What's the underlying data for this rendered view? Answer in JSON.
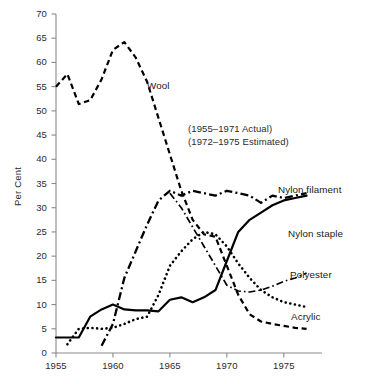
{
  "chart_data": {
    "type": "line",
    "title": "",
    "xlabel": "",
    "ylabel": "Per Cent",
    "xlim": [
      1955,
      1977.3
    ],
    "ylim": [
      0,
      70
    ],
    "grid": false,
    "legend_position": "inline-labels",
    "xticks": [
      1955,
      1960,
      1965,
      1970,
      1975
    ],
    "xtick_labels": [
      "1955",
      "1960",
      "1965",
      "1970",
      "1975"
    ],
    "yticks": [
      0,
      5,
      10,
      15,
      20,
      25,
      30,
      35,
      40,
      45,
      50,
      55,
      60,
      65,
      70
    ],
    "ytick_labels": [
      "0",
      "5",
      "10",
      "15",
      "20",
      "25",
      "30",
      "35",
      "40",
      "45",
      "50",
      "55",
      "60",
      "65",
      "70"
    ],
    "annotations": [
      "(1955–1971 Actual)",
      "(1972–1975 Estimated)"
    ],
    "series": [
      {
        "name": "Wool",
        "label": "Wool",
        "style": "dashed",
        "x": [
          1955,
          1956,
          1957,
          1958,
          1959,
          1960,
          1961,
          1962,
          1963,
          1964,
          1965,
          1966,
          1967,
          1968,
          1969,
          1970,
          1971,
          1972,
          1973,
          1974,
          1975,
          1976,
          1977
        ],
        "values": [
          55.0,
          57.6,
          51.4,
          52.2,
          56.5,
          62.6,
          64.2,
          61.0,
          56.0,
          48.5,
          41.0,
          33.5,
          27.5,
          24.5,
          24.0,
          18.0,
          12.0,
          8.0,
          6.5,
          6.0,
          5.6,
          5.2,
          5.0
        ]
      },
      {
        "name": "Nylon filament",
        "label": "Nylon filament",
        "style": "dashdot",
        "x": [
          1959,
          1960,
          1961,
          1962,
          1963,
          1964,
          1965,
          1966,
          1967,
          1968,
          1969,
          1970,
          1971,
          1972,
          1973,
          1974,
          1975,
          1976,
          1977
        ],
        "values": [
          1.5,
          6.0,
          15.5,
          21.0,
          26.5,
          31.5,
          33.5,
          32.5,
          33.5,
          33.0,
          32.5,
          33.5,
          33.0,
          32.5,
          31.0,
          32.5,
          32.0,
          32.5,
          33.0
        ]
      },
      {
        "name": "Nylon staple",
        "label": "Nylon staple",
        "style": "solid",
        "x": [
          1955,
          1956,
          1957,
          1958,
          1959,
          1960,
          1961,
          1962,
          1963,
          1964,
          1965,
          1966,
          1967,
          1968,
          1969,
          1970,
          1971,
          1972,
          1973,
          1974,
          1975,
          1976,
          1977
        ],
        "values": [
          3.2,
          3.2,
          3.2,
          7.5,
          9.0,
          10.0,
          9.0,
          8.8,
          8.8,
          8.6,
          11.0,
          11.5,
          10.5,
          11.5,
          13.0,
          19.0,
          25.0,
          27.5,
          29.0,
          30.5,
          31.5,
          32.0,
          32.5
        ]
      },
      {
        "name": "Polyester",
        "label": "Polyester",
        "style": "dashdot-thin",
        "x": [
          1965,
          1966,
          1967,
          1968,
          1969,
          1970,
          1971,
          1972,
          1973,
          1974,
          1975,
          1976,
          1977
        ],
        "values": [
          33.0,
          30.0,
          26.0,
          22.0,
          18.0,
          14.0,
          12.8,
          12.6,
          13.0,
          13.8,
          14.8,
          15.5,
          16.5
        ]
      },
      {
        "name": "Acrylic",
        "label": "Acrylic",
        "style": "dotted",
        "x": [
          1956,
          1957,
          1958,
          1959,
          1960,
          1961,
          1962,
          1963,
          1964,
          1965,
          1966,
          1967,
          1968,
          1969,
          1970,
          1971,
          1972,
          1973,
          1974,
          1975,
          1976,
          1977
        ],
        "values": [
          1.8,
          5.0,
          5.2,
          5.0,
          5.2,
          6.0,
          7.0,
          7.5,
          12.0,
          18.0,
          21.0,
          23.5,
          25.0,
          24.5,
          22.0,
          18.5,
          15.5,
          13.0,
          11.5,
          10.5,
          10.0,
          9.5
        ]
      }
    ],
    "series_label_positions": [
      {
        "name": "Wool",
        "x": 147,
        "y": 80
      },
      {
        "name": "Nylon filament",
        "x": 278,
        "y": 184
      },
      {
        "name": "Nylon staple",
        "x": 288,
        "y": 228
      },
      {
        "name": "Polyester",
        "x": 290,
        "y": 269
      },
      {
        "name": "Acrylic",
        "x": 291,
        "y": 311
      }
    ],
    "annotation_positions": [
      {
        "x": 188,
        "y": 123
      },
      {
        "x": 188,
        "y": 136
      }
    ],
    "colors": {
      "line": "#000000",
      "axis": "#8a8a8a",
      "text": "#1a1a1a",
      "background": "#ffffff"
    }
  }
}
